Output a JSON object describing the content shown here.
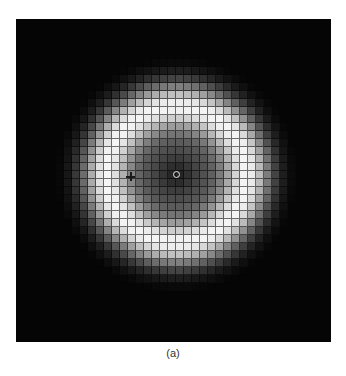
{
  "figure": {
    "caption": "(a)",
    "grid": {
      "cell_px": 8,
      "cols": 40,
      "rows": 41
    },
    "ring": {
      "center_x": 161,
      "center_y": 156,
      "radius_x": 70,
      "radius_y": 68,
      "width": 30,
      "center_level": 0.32,
      "peak_level": 1.0
    },
    "markers": {
      "cross": {
        "name": "plus-marker",
        "x": 114,
        "y": 157
      },
      "circle": {
        "name": "circle-marker",
        "x": 161,
        "y": 156
      }
    },
    "colors": {
      "background": "#050505",
      "cross": "#1a1a1a",
      "circle": "#e8e8e8"
    }
  }
}
